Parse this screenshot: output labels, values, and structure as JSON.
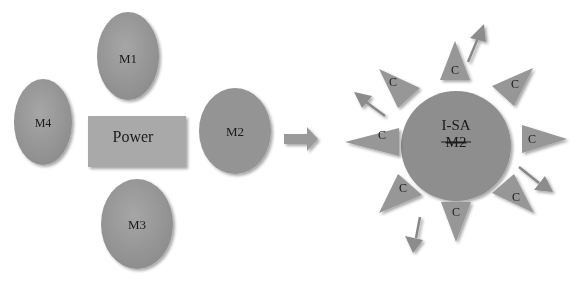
{
  "diagram": {
    "left_cluster": {
      "center": {
        "label": "Power",
        "shape": "rectangle"
      },
      "modules": [
        {
          "id": "m1",
          "label": "M1",
          "position": "top"
        },
        {
          "id": "m2",
          "label": "M2",
          "position": "right"
        },
        {
          "id": "m3",
          "label": "M3",
          "position": "bottom"
        },
        {
          "id": "m4",
          "label": "M4",
          "position": "left"
        }
      ]
    },
    "transition_arrow": {
      "direction": "right"
    },
    "right_cluster": {
      "core": {
        "label_line1": "I-SA",
        "label_line2": "M2",
        "label_line2_style": "strikethrough",
        "shape": "circle"
      },
      "satellites": [
        {
          "label": "C",
          "angle_deg": -90
        },
        {
          "label": "C",
          "angle_deg": -45
        },
        {
          "label": "C",
          "angle_deg": 0
        },
        {
          "label": "C",
          "angle_deg": 45
        },
        {
          "label": "C",
          "angle_deg": 90
        },
        {
          "label": "C",
          "angle_deg": 135
        },
        {
          "label": "C",
          "angle_deg": 180
        },
        {
          "label": "C",
          "angle_deg": -135
        }
      ],
      "outgoing_arrows": 4
    },
    "colors": {
      "shape_fill": "#9a9a9a",
      "shape_fill_dark": "#8a8a8a",
      "rect_fill": "#a8a8a8",
      "arrow_fill": "#8c8c8c",
      "text": "#1a1a1a",
      "background": "#ffffff"
    }
  }
}
